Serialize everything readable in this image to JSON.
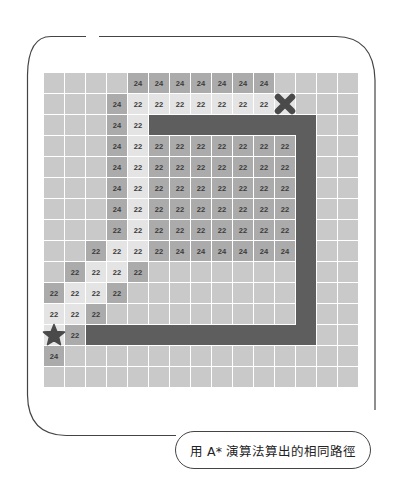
{
  "caption": "用 A* 演算法算出的相同路徑",
  "colors": {
    "empty": "#c9c9c9",
    "visited_light": "#e4e4e4",
    "frontier_medium": "#ababab",
    "wall": "#5e5e5e",
    "marker": "#4a4a4a",
    "text": "#3a3a3a"
  },
  "grid": {
    "cols": 15,
    "rows": 15,
    "start": {
      "row": 12,
      "col": 0,
      "icon": "star-icon"
    },
    "goal": {
      "row": 1,
      "col": 11,
      "icon": "x-icon"
    },
    "walls": [
      {
        "row": 2,
        "col_from": 5,
        "col_to": 12
      },
      {
        "col": 12,
        "row_from": 2,
        "row_to": 12
      },
      {
        "row": 12,
        "col_from": 2,
        "col_to": 12
      }
    ],
    "cells": [
      {
        "r": 0,
        "c": 4,
        "v": "24",
        "t": "m"
      },
      {
        "r": 0,
        "c": 5,
        "v": "24",
        "t": "m"
      },
      {
        "r": 0,
        "c": 6,
        "v": "24",
        "t": "m"
      },
      {
        "r": 0,
        "c": 7,
        "v": "24",
        "t": "m"
      },
      {
        "r": 0,
        "c": 8,
        "v": "24",
        "t": "m"
      },
      {
        "r": 0,
        "c": 9,
        "v": "24",
        "t": "m"
      },
      {
        "r": 0,
        "c": 10,
        "v": "24",
        "t": "m"
      },
      {
        "r": 1,
        "c": 3,
        "v": "24",
        "t": "m"
      },
      {
        "r": 1,
        "c": 4,
        "v": "22",
        "t": "l"
      },
      {
        "r": 1,
        "c": 5,
        "v": "22",
        "t": "l"
      },
      {
        "r": 1,
        "c": 6,
        "v": "22",
        "t": "l"
      },
      {
        "r": 1,
        "c": 7,
        "v": "22",
        "t": "l"
      },
      {
        "r": 1,
        "c": 8,
        "v": "22",
        "t": "l"
      },
      {
        "r": 1,
        "c": 9,
        "v": "22",
        "t": "l"
      },
      {
        "r": 1,
        "c": 10,
        "v": "22",
        "t": "l"
      },
      {
        "r": 1,
        "c": 11,
        "v": "",
        "t": "l"
      },
      {
        "r": 2,
        "c": 3,
        "v": "24",
        "t": "m"
      },
      {
        "r": 2,
        "c": 4,
        "v": "22",
        "t": "l"
      },
      {
        "r": 3,
        "c": 3,
        "v": "24",
        "t": "m"
      },
      {
        "r": 3,
        "c": 4,
        "v": "22",
        "t": "l"
      },
      {
        "r": 3,
        "c": 5,
        "v": "22",
        "t": "m"
      },
      {
        "r": 3,
        "c": 6,
        "v": "22",
        "t": "m"
      },
      {
        "r": 3,
        "c": 7,
        "v": "22",
        "t": "m"
      },
      {
        "r": 3,
        "c": 8,
        "v": "22",
        "t": "m"
      },
      {
        "r": 3,
        "c": 9,
        "v": "22",
        "t": "m"
      },
      {
        "r": 3,
        "c": 10,
        "v": "22",
        "t": "m"
      },
      {
        "r": 3,
        "c": 11,
        "v": "22",
        "t": "m"
      },
      {
        "r": 4,
        "c": 3,
        "v": "24",
        "t": "m"
      },
      {
        "r": 4,
        "c": 4,
        "v": "22",
        "t": "l"
      },
      {
        "r": 4,
        "c": 5,
        "v": "22",
        "t": "m"
      },
      {
        "r": 4,
        "c": 6,
        "v": "22",
        "t": "m"
      },
      {
        "r": 4,
        "c": 7,
        "v": "22",
        "t": "m"
      },
      {
        "r": 4,
        "c": 8,
        "v": "22",
        "t": "m"
      },
      {
        "r": 4,
        "c": 9,
        "v": "22",
        "t": "m"
      },
      {
        "r": 4,
        "c": 10,
        "v": "22",
        "t": "m"
      },
      {
        "r": 4,
        "c": 11,
        "v": "22",
        "t": "m"
      },
      {
        "r": 5,
        "c": 3,
        "v": "24",
        "t": "m"
      },
      {
        "r": 5,
        "c": 4,
        "v": "22",
        "t": "l"
      },
      {
        "r": 5,
        "c": 5,
        "v": "22",
        "t": "m"
      },
      {
        "r": 5,
        "c": 6,
        "v": "22",
        "t": "m"
      },
      {
        "r": 5,
        "c": 7,
        "v": "22",
        "t": "m"
      },
      {
        "r": 5,
        "c": 8,
        "v": "22",
        "t": "m"
      },
      {
        "r": 5,
        "c": 9,
        "v": "22",
        "t": "m"
      },
      {
        "r": 5,
        "c": 10,
        "v": "22",
        "t": "m"
      },
      {
        "r": 5,
        "c": 11,
        "v": "22",
        "t": "m"
      },
      {
        "r": 6,
        "c": 3,
        "v": "24",
        "t": "m"
      },
      {
        "r": 6,
        "c": 4,
        "v": "22",
        "t": "l"
      },
      {
        "r": 6,
        "c": 5,
        "v": "22",
        "t": "m"
      },
      {
        "r": 6,
        "c": 6,
        "v": "22",
        "t": "m"
      },
      {
        "r": 6,
        "c": 7,
        "v": "22",
        "t": "m"
      },
      {
        "r": 6,
        "c": 8,
        "v": "22",
        "t": "m"
      },
      {
        "r": 6,
        "c": 9,
        "v": "22",
        "t": "m"
      },
      {
        "r": 6,
        "c": 10,
        "v": "22",
        "t": "m"
      },
      {
        "r": 6,
        "c": 11,
        "v": "22",
        "t": "m"
      },
      {
        "r": 7,
        "c": 3,
        "v": "22",
        "t": "m"
      },
      {
        "r": 7,
        "c": 4,
        "v": "22",
        "t": "l"
      },
      {
        "r": 7,
        "c": 5,
        "v": "22",
        "t": "m"
      },
      {
        "r": 7,
        "c": 6,
        "v": "22",
        "t": "m"
      },
      {
        "r": 7,
        "c": 7,
        "v": "22",
        "t": "m"
      },
      {
        "r": 7,
        "c": 8,
        "v": "22",
        "t": "m"
      },
      {
        "r": 7,
        "c": 9,
        "v": "22",
        "t": "m"
      },
      {
        "r": 7,
        "c": 10,
        "v": "22",
        "t": "m"
      },
      {
        "r": 7,
        "c": 11,
        "v": "22",
        "t": "m"
      },
      {
        "r": 8,
        "c": 2,
        "v": "22",
        "t": "m"
      },
      {
        "r": 8,
        "c": 3,
        "v": "22",
        "t": "l"
      },
      {
        "r": 8,
        "c": 4,
        "v": "22",
        "t": "l"
      },
      {
        "r": 8,
        "c": 5,
        "v": "22",
        "t": "m"
      },
      {
        "r": 8,
        "c": 6,
        "v": "24",
        "t": "m"
      },
      {
        "r": 8,
        "c": 7,
        "v": "24",
        "t": "m"
      },
      {
        "r": 8,
        "c": 8,
        "v": "24",
        "t": "m"
      },
      {
        "r": 8,
        "c": 9,
        "v": "24",
        "t": "m"
      },
      {
        "r": 8,
        "c": 10,
        "v": "24",
        "t": "m"
      },
      {
        "r": 8,
        "c": 11,
        "v": "24",
        "t": "m"
      },
      {
        "r": 9,
        "c": 1,
        "v": "22",
        "t": "m"
      },
      {
        "r": 9,
        "c": 2,
        "v": "22",
        "t": "l"
      },
      {
        "r": 9,
        "c": 3,
        "v": "22",
        "t": "l"
      },
      {
        "r": 9,
        "c": 4,
        "v": "22",
        "t": "m"
      },
      {
        "r": 10,
        "c": 0,
        "v": "22",
        "t": "m"
      },
      {
        "r": 10,
        "c": 1,
        "v": "22",
        "t": "l"
      },
      {
        "r": 10,
        "c": 2,
        "v": "22",
        "t": "l"
      },
      {
        "r": 10,
        "c": 3,
        "v": "22",
        "t": "m"
      },
      {
        "r": 11,
        "c": 0,
        "v": "22",
        "t": "l"
      },
      {
        "r": 11,
        "c": 1,
        "v": "22",
        "t": "l"
      },
      {
        "r": 11,
        "c": 2,
        "v": "22",
        "t": "m"
      },
      {
        "r": 12,
        "c": 0,
        "v": "",
        "t": "l"
      },
      {
        "r": 12,
        "c": 1,
        "v": "22",
        "t": "m"
      },
      {
        "r": 13,
        "c": 0,
        "v": "24",
        "t": "m"
      }
    ]
  }
}
